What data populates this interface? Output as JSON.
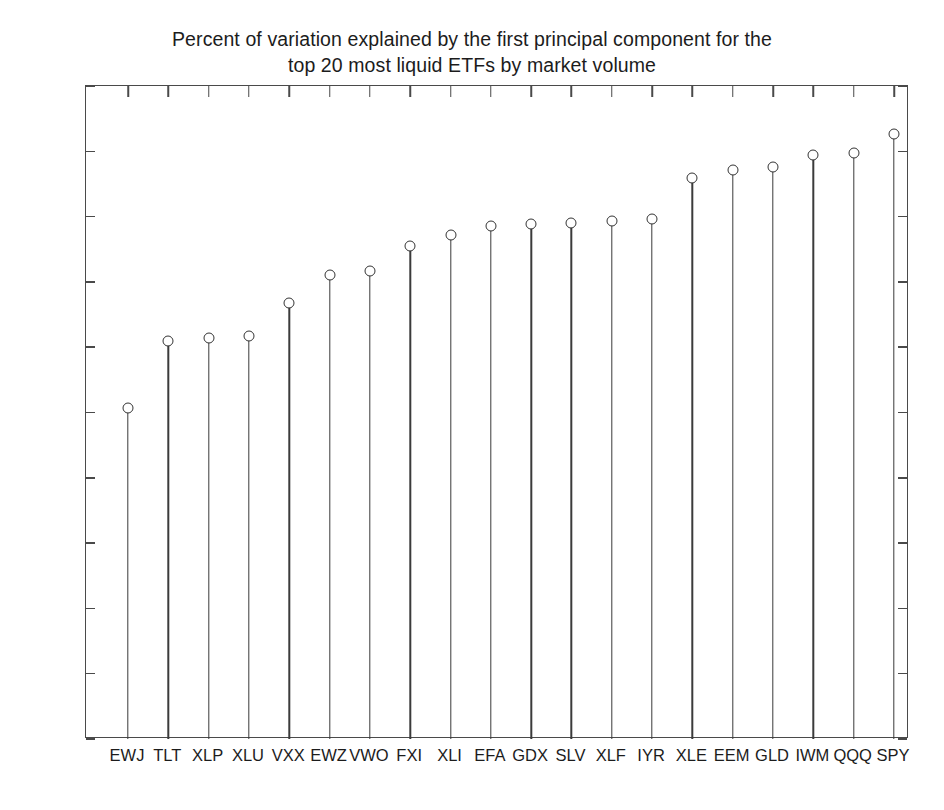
{
  "chart_data": {
    "type": "scatter",
    "title": "Percent of variation explained by the first principal component for the top 20 most liquid ETFs by market volume",
    "title_lines": [
      "Percent of variation explained by the first principal component for the",
      "top 20 most liquid ETFs by market volume"
    ],
    "xlabel": "",
    "ylabel": "",
    "ylim": [
      0,
      1
    ],
    "yticks": [
      0,
      0.1,
      0.2,
      0.3,
      0.4,
      0.5,
      0.6,
      0.7,
      0.8,
      0.9,
      1
    ],
    "ytick_labels": [
      "0",
      "0.1",
      "0.2",
      "0.3",
      "0.4",
      "0.5",
      "0.6",
      "0.7",
      "0.8",
      "0.9",
      "1"
    ],
    "grid": false,
    "legend": null,
    "marker_style": "open-circle",
    "stem_plot": true,
    "categories": [
      "EWJ",
      "TLT",
      "XLP",
      "XLU",
      "VXX",
      "EWZ",
      "VWO",
      "FXI",
      "XLI",
      "EFA",
      "GDX",
      "SLV",
      "XLF",
      "IYR",
      "XLE",
      "EEM",
      "GLD",
      "IWM",
      "QQQ",
      "SPY"
    ],
    "values": [
      0.507,
      0.61,
      0.614,
      0.617,
      0.668,
      0.71,
      0.716,
      0.755,
      0.772,
      0.786,
      0.788,
      0.79,
      0.793,
      0.796,
      0.859,
      0.872,
      0.876,
      0.895,
      0.897,
      0.927
    ]
  },
  "axes": {
    "x_axis_name": "etf-ticker-axis",
    "y_axis_name": "variance-explained-axis"
  }
}
